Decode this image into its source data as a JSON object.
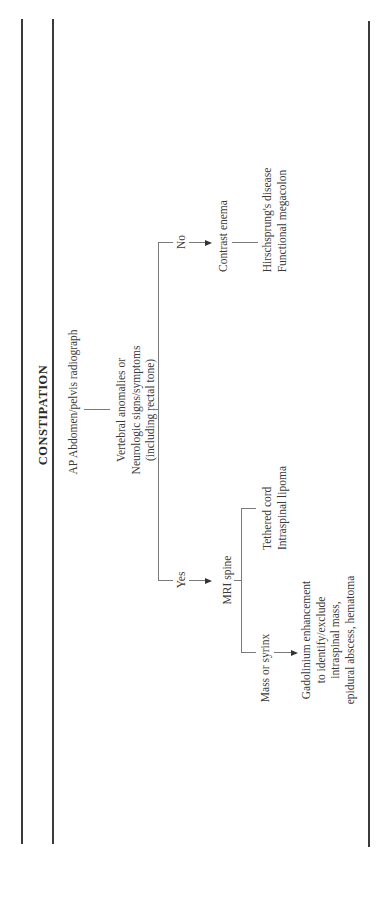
{
  "title": "CONSTIPATION",
  "nodes": {
    "start": "AP Abdomen/pelvis radiograph",
    "question": [
      "Vertebral anomalies or",
      "Neurologic signs/symptoms",
      "(including rectal tone)"
    ],
    "no_label": "No",
    "yes_label": "Yes",
    "contrast_enema": "Contrast enema",
    "no_outcomes": [
      "Hirschsprung's disease",
      "Functional megacolon"
    ],
    "mri_spine": "MRI spine",
    "mri_outcomes": [
      "Tethered cord",
      "Intraspinal lipoma"
    ],
    "mass_label": "Mass or syrinx",
    "gadolinium": [
      "Gadolinium enhancement",
      "to identify/exclude",
      "intraspinal mass,",
      "epidural abscess, hematoma"
    ]
  }
}
